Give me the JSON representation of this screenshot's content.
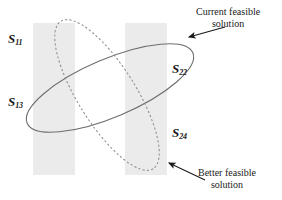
{
  "figure": {
    "type": "diagram",
    "background_color": "#ffffff",
    "band_fill_color": "#ebebeb",
    "curve_color": "#6e6e6e",
    "text_color": "#1a1a1a"
  },
  "bands": [
    {
      "name": "band-left",
      "x": 33,
      "y": 23,
      "width": 42,
      "height": 152
    },
    {
      "name": "band-right",
      "x": 125,
      "y": 23,
      "width": 42,
      "height": 152
    }
  ],
  "ellipses": [
    {
      "name": "solid-ellipse",
      "style": "solid",
      "cx": 110,
      "cy": 88,
      "rx": 90,
      "ry": 29,
      "rotation": -23
    },
    {
      "name": "dashed-ellipse",
      "style": "dashed",
      "cx": 107,
      "cy": 95,
      "rx": 87,
      "ry": 29,
      "rotation": 58
    }
  ],
  "labels": [
    {
      "name": "label-s11",
      "base": "S",
      "sub": "11",
      "x": 8,
      "y": 32
    },
    {
      "name": "label-s22",
      "base": "S",
      "sub": "22",
      "x": 172,
      "y": 62
    },
    {
      "name": "label-s13",
      "base": "S",
      "sub": "13",
      "x": 8,
      "y": 95
    },
    {
      "name": "label-s24",
      "base": "S",
      "sub": "24",
      "x": 172,
      "y": 126
    }
  ],
  "callouts": [
    {
      "name": "callout-current",
      "line1": "Current feasible",
      "line2": "solution",
      "text_x": 196,
      "text_y": 6,
      "arrow": {
        "x1": 225,
        "y1": 27,
        "x2": 189,
        "y2": 37
      }
    },
    {
      "name": "callout-better",
      "line1": "Better feasible",
      "line2": "solution",
      "text_x": 198,
      "text_y": 167,
      "arrow": {
        "x1": 205,
        "y1": 180,
        "x2": 169,
        "y2": 163
      }
    }
  ]
}
